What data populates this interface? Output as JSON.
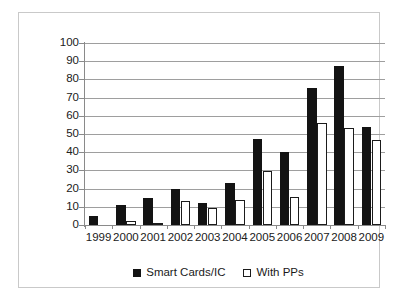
{
  "chart_data": {
    "type": "bar",
    "title": "",
    "subtitle": "",
    "xlabel": "",
    "ylabel": "",
    "categories": [
      "1999",
      "2000",
      "2001",
      "2002",
      "2003",
      "2004",
      "2005",
      "2006",
      "2007",
      "2008",
      "2009"
    ],
    "series": [
      {
        "name": "Smart Cards/IC",
        "color": "#131313",
        "style": "filled",
        "values": [
          5,
          11,
          15,
          20,
          12,
          23,
          47,
          40,
          75.5,
          87.5,
          54
        ]
      },
      {
        "name": "With PPs",
        "color": "#ffffff",
        "style": "outlined",
        "values": [
          0,
          2,
          1,
          13,
          9.5,
          14,
          29.5,
          15.5,
          56,
          53.5,
          46.5
        ]
      }
    ],
    "ylim": [
      0,
      100
    ],
    "ytick_step": 10,
    "ytick_labels": [
      "100",
      "90",
      "80",
      "70",
      "60",
      "50",
      "40",
      "30",
      "20",
      "10",
      "0"
    ],
    "grid": true,
    "grid_axis": "y",
    "grid_color": "#9e9e9e",
    "legend_position": "bottom",
    "legend": [
      {
        "label": "Smart Cards/IC",
        "swatch": "filled-square",
        "color": "#131313"
      },
      {
        "label": "With PPs",
        "swatch": "outlined-square",
        "color": "#ffffff"
      }
    ],
    "frame_color": "#c9c9c9",
    "background": "#ffffff"
  }
}
